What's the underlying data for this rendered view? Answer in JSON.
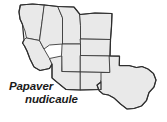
{
  "figure": {
    "type": "distribution-map",
    "subject_region": "Western United States",
    "background_color": "#ffffff"
  },
  "caption": {
    "genus": "Papaver",
    "epithet": "nudicaule",
    "full_name": "Papaver nudicaule",
    "style": "bold-italic",
    "color": "#1a1a1a"
  },
  "map": {
    "fill_color": "#e9e9e9",
    "border_color": "#3b3b3b",
    "outline_color": "#2e2e2e",
    "states": [
      {
        "name": "washington-oregon",
        "label": ""
      },
      {
        "name": "california",
        "label": ""
      },
      {
        "name": "nevada",
        "label": ""
      },
      {
        "name": "idaho",
        "label": ""
      },
      {
        "name": "montana",
        "label": ""
      },
      {
        "name": "wyoming",
        "label": ""
      },
      {
        "name": "utah",
        "label": ""
      },
      {
        "name": "colorado",
        "label": ""
      },
      {
        "name": "arizona",
        "label": ""
      },
      {
        "name": "new-mexico",
        "label": ""
      },
      {
        "name": "texas",
        "label": ""
      }
    ]
  }
}
